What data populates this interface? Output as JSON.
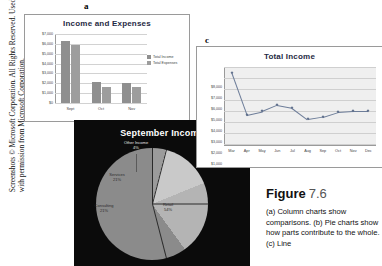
{
  "credit": {
    "line1": "Screenshots © Microsoft Corporation. All Rights Reserved. Used",
    "line2": "with permission from Microsoft Corporation."
  },
  "panels": {
    "a_letter": "a",
    "b_letter": "b",
    "c_letter": "c"
  },
  "caption": {
    "figure_word": "Figure",
    "figure_number": "7.6",
    "body": "(a) Column charts show comparisons. (b) Pie charts show how parts contribute to the whole. (c) Line"
  },
  "chart_data": [
    {
      "id": "chart-a",
      "type": "bar",
      "title": "Income and Expenses",
      "xlabel": "",
      "ylabel": "",
      "categories": [
        "Sept",
        "Oct",
        "Nov"
      ],
      "series": [
        {
          "name": "Total Income",
          "values": [
            6400,
            2150,
            2100
          ],
          "color": "#8f8f8f"
        },
        {
          "name": "Total Expenses",
          "values": [
            6000,
            1700,
            1650
          ],
          "color": "#9d9d9d"
        }
      ],
      "ylim": [
        0,
        7000
      ],
      "yticks": [
        "$7,000",
        "$6,000",
        "$5,000",
        "$4,000",
        "$3,000",
        "$2,000",
        "$1,000",
        "$0"
      ],
      "grid": true,
      "legend_position": "right"
    },
    {
      "id": "chart-b",
      "type": "pie",
      "title": "September Income",
      "labels": [
        "Retail",
        "Consulting",
        "Services",
        "Other Income"
      ],
      "percents": [
        "54%",
        "21%",
        "21%",
        "4%"
      ],
      "values": [
        54,
        21,
        21,
        4
      ],
      "colors": [
        "#8b8b8b",
        "#b4b4b4",
        "#c9c9c9",
        "#9b9b9b"
      ],
      "background": "#0b0b0b",
      "title_color": "#ffffff"
    },
    {
      "id": "chart-c",
      "type": "line",
      "title": "Total Income",
      "xlabel": "",
      "ylabel": "",
      "categories": [
        "Mar",
        "Apr",
        "May",
        "Jun",
        "Jul",
        "Aug",
        "Sep",
        "Oct",
        "Nov",
        "Dec"
      ],
      "values": [
        7400,
        3100,
        3450,
        4100,
        3800,
        2650,
        2900,
        3400,
        3500,
        3500
      ],
      "ylim": [
        0,
        8000
      ],
      "yticks": [
        "$8,000",
        "$7,000",
        "$6,000",
        "$5,000",
        "$4,000",
        "$3,000",
        "$2,000",
        "$1,000"
      ],
      "grid": true,
      "line_color": "#6d7d99",
      "marker_color": "#5d6d8a"
    }
  ]
}
